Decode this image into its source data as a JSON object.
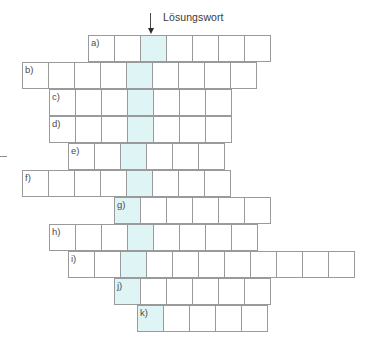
{
  "annotation": {
    "solution_label": "Lösungswort",
    "label_x": 163,
    "label_y": 11,
    "arrow_x": 150,
    "arrow_y": 13
  },
  "grid": {
    "cell_size": 27,
    "origin_y": 35,
    "highlight_color": "#dff4f4",
    "border_color": "#9a9a9a",
    "highlight_x": 137,
    "rows": [
      {
        "label": "a)",
        "x": 88,
        "y": 35,
        "cells": 7,
        "highlight_index": 2
      },
      {
        "label": "b)",
        "x": 22,
        "y": 62,
        "cells": 9,
        "highlight_index": 4
      },
      {
        "label": "c)",
        "x": 49,
        "y": 89,
        "cells": 7,
        "highlight_index": 3
      },
      {
        "label": "d)",
        "x": 49,
        "y": 116,
        "cells": 7,
        "highlight_index": 3
      },
      {
        "label": "e)",
        "x": 68,
        "y": 143,
        "cells": 6,
        "highlight_index": 2
      },
      {
        "label": "f)",
        "x": 22,
        "y": 170,
        "cells": 8,
        "highlight_index": 4
      },
      {
        "label": "g)",
        "x": 114,
        "y": 197,
        "cells": 6,
        "highlight_index": 0
      },
      {
        "label": "h)",
        "x": 49,
        "y": 224,
        "cells": 8,
        "highlight_index": 3
      },
      {
        "label": "i)",
        "x": 68,
        "y": 251,
        "cells": 11,
        "highlight_index": 2
      },
      {
        "label": "j)",
        "x": 114,
        "y": 278,
        "cells": 6,
        "highlight_index": 0
      },
      {
        "label": "k)",
        "x": 137,
        "y": 305,
        "cells": 5,
        "highlight_index": 0
      }
    ]
  },
  "edge_tick": {
    "x": 0,
    "y": 156
  }
}
